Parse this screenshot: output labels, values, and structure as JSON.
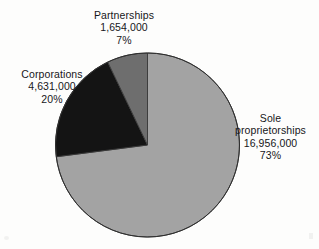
{
  "chart_data": {
    "type": "pie",
    "title": "",
    "subtitle": "",
    "xlabel": "",
    "ylabel": "",
    "legend_position": "none",
    "grid": false,
    "start_angle_deg": 0,
    "direction": "clockwise",
    "categories": [
      "Sole proprietorships",
      "Corporations",
      "Partnerships"
    ],
    "values": [
      16956000,
      4631000,
      1654000
    ],
    "percentages": [
      73,
      20,
      7
    ],
    "value_labels": [
      "16,956,000",
      "4,631,000",
      "1,654,000"
    ],
    "percent_labels": [
      "73%",
      "20%",
      "7%"
    ],
    "colors": [
      "#a3a3a3",
      "#141414",
      "#6e6e6e"
    ],
    "slices": [
      {
        "name": "Sole proprietorships",
        "name_lines": [
          "Sole",
          "proprietorships"
        ],
        "value": 16956000,
        "value_label": "16,956,000",
        "percent": 73,
        "percent_label": "73%",
        "color": "#a3a3a3",
        "start_deg": 0,
        "end_deg": 262.8
      },
      {
        "name": "Corporations",
        "name_lines": [
          "Corporations"
        ],
        "value": 4631000,
        "value_label": "4,631,000",
        "percent": 20,
        "percent_label": "20%",
        "color": "#141414",
        "start_deg": 262.8,
        "end_deg": 334.8
      },
      {
        "name": "Partnerships",
        "name_lines": [
          "Partnerships"
        ],
        "value": 1654000,
        "value_label": "1,654,000",
        "percent": 7,
        "percent_label": "7%",
        "color": "#6e6e6e",
        "start_deg": 334.8,
        "end_deg": 360
      }
    ]
  },
  "labels": {
    "partnerships": {
      "name": "Partnerships",
      "value": "1,654,000",
      "percent": "7%"
    },
    "corporations": {
      "name": "Corporations",
      "value": "4,631,000",
      "percent": "20%"
    },
    "sole": {
      "name_line1": "Sole",
      "name_line2": "proprietorships",
      "value": "16,956,000",
      "percent": "73%"
    }
  },
  "style": {
    "background": "#fdfdfc",
    "text_color": "#17171a",
    "outline_color": "#3a3a3a"
  }
}
